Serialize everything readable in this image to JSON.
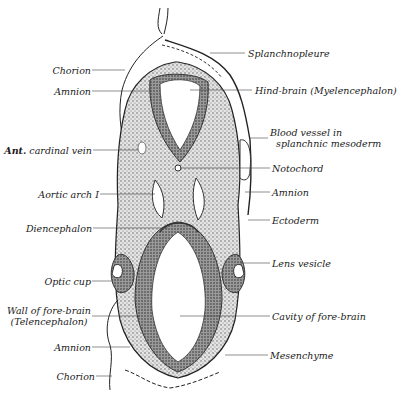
{
  "figure": {
    "colors": {
      "ink": "#1a1a1a",
      "tissue": "#c9c9c9",
      "dense": "#8a8a8a",
      "background": "#ffffff"
    }
  },
  "labels_left": [
    {
      "id": "chorion-top",
      "text": "Chorion"
    },
    {
      "id": "amnion-top",
      "text": "Amnion"
    },
    {
      "id": "ant-cardinal-vein",
      "prefix": "Ant.",
      "text": "cardinal vein"
    },
    {
      "id": "aortic-arch",
      "text": "Aortic arch I"
    },
    {
      "id": "diencephalon",
      "text": "Diencephalon"
    },
    {
      "id": "optic-cup",
      "text": "Optic cup"
    },
    {
      "id": "wall-fore-brain",
      "text": "Wall of fore-brain",
      "text2": "(Telencephalon)"
    },
    {
      "id": "amnion-bottom",
      "text": "Amnion"
    },
    {
      "id": "chorion-bottom",
      "text": "Chorion"
    }
  ],
  "labels_right": [
    {
      "id": "splanchnopleure",
      "text": "Splanchnopleure"
    },
    {
      "id": "hind-brain",
      "text": "Hind-brain (Myelencephalon)"
    },
    {
      "id": "blood-vessel",
      "text": "Blood vessel in",
      "text2": "splanchnic mesoderm"
    },
    {
      "id": "notochord",
      "text": "Notochord"
    },
    {
      "id": "amnion-right",
      "text": "Amnion"
    },
    {
      "id": "ectoderm",
      "text": "Ectoderm"
    },
    {
      "id": "lens-vesicle",
      "text": "Lens vesicle"
    },
    {
      "id": "cavity-fore-brain",
      "text": "Cavity of fore-brain"
    },
    {
      "id": "mesenchyme",
      "text": "Mesenchyme"
    }
  ]
}
